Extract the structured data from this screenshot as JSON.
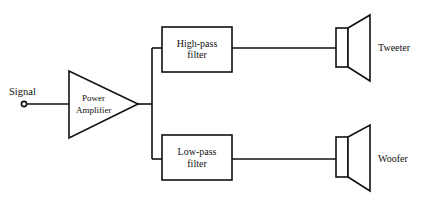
{
  "diagram": {
    "type": "block-diagram",
    "title": "",
    "input": {
      "label": "Signal"
    },
    "amplifier": {
      "line1": "Power",
      "line2": "Amplifier"
    },
    "filters": [
      {
        "id": "high-pass",
        "line1": "High-pass",
        "line2": "filter"
      },
      {
        "id": "low-pass",
        "line1": "Low-pass",
        "line2": "filter"
      }
    ],
    "speakers": [
      {
        "id": "tweeter",
        "label": "Tweeter"
      },
      {
        "id": "woofer",
        "label": "Woofer"
      }
    ],
    "connections": [
      {
        "from": "Signal",
        "to": "Power Amplifier"
      },
      {
        "from": "Power Amplifier",
        "to": "High-pass filter"
      },
      {
        "from": "Power Amplifier",
        "to": "Low-pass filter"
      },
      {
        "from": "High-pass filter",
        "to": "Tweeter"
      },
      {
        "from": "Low-pass filter",
        "to": "Woofer"
      }
    ],
    "colors": {
      "line": "#111111",
      "background": "#ffffff"
    }
  }
}
